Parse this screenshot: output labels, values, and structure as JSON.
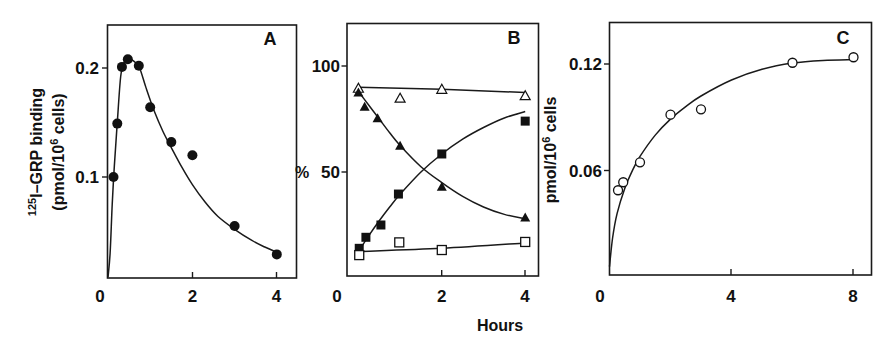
{
  "figure": {
    "x_axis_label": "Hours",
    "panels": [
      {
        "id": "A",
        "label": "A",
        "ylabel_line1_sup": "125",
        "ylabel_line1": "I–GRP binding",
        "ylabel_line2_pre": "(pmol/10",
        "ylabel_line2_sup": "6",
        "ylabel_line2_post": " cells)",
        "xticks": [
          "0",
          "2",
          "4"
        ],
        "yticks": [
          "0.1",
          "0.2"
        ]
      },
      {
        "id": "B",
        "label": "B",
        "ylabel": "%",
        "xticks": [
          "0",
          "2",
          "4"
        ],
        "yticks": [
          "50",
          "100"
        ]
      },
      {
        "id": "C",
        "label": "C",
        "ylabel_pre": "pmol/10",
        "ylabel_sup": "6",
        "ylabel_post": " cells",
        "xticks": [
          "0",
          "4",
          "8"
        ],
        "yticks": [
          "0.06",
          "0.12"
        ]
      }
    ]
  },
  "chart_data": [
    {
      "panel": "A",
      "type": "line",
      "title": "A",
      "xlabel": "Hours",
      "ylabel": "125I-GRP binding (pmol/10^6 cells)",
      "xlim": [
        0,
        4.4
      ],
      "ylim": [
        0.008,
        0.24
      ],
      "xticks": [
        0,
        2,
        4
      ],
      "yticks": [
        0.1,
        0.2
      ],
      "grid": false,
      "series": [
        {
          "name": "125I-GRP binding (total)",
          "marker": "filled-circle",
          "x": [
            0.13,
            0.22,
            0.33,
            0.47,
            0.73,
            1.0,
            1.5,
            2.0,
            3.0,
            4.0
          ],
          "y": [
            0.1,
            0.149,
            0.201,
            0.208,
            0.202,
            0.164,
            0.132,
            0.12,
            0.055,
            0.029
          ]
        }
      ],
      "fit_curve": {
        "x": [
          0,
          0.05,
          0.1,
          0.15,
          0.22,
          0.3,
          0.38,
          0.47,
          0.55,
          0.65,
          0.75,
          0.9,
          1.1,
          1.3,
          1.5,
          1.75,
          2.0,
          2.3,
          2.6,
          3.0,
          3.4,
          3.7,
          4.0
        ],
        "y": [
          0.008,
          0.03,
          0.075,
          0.11,
          0.15,
          0.192,
          0.205,
          0.209,
          0.208,
          0.205,
          0.2,
          0.182,
          0.16,
          0.142,
          0.127,
          0.109,
          0.093,
          0.077,
          0.064,
          0.052,
          0.042,
          0.036,
          0.031
        ]
      }
    },
    {
      "panel": "B",
      "type": "line",
      "title": "B",
      "xlabel": "Hours",
      "ylabel": "%",
      "xlim": [
        -0.27,
        4.3
      ],
      "ylim": [
        0,
        120
      ],
      "xticks": [
        0,
        2,
        4
      ],
      "yticks": [
        50,
        100
      ],
      "grid": false,
      "series": [
        {
          "name": "open triangles",
          "marker": "open-triangle",
          "x": [
            0.0,
            1.0,
            2.0,
            4.0
          ],
          "y": [
            89.5,
            84.8,
            89,
            86
          ]
        },
        {
          "name": "filled triangles",
          "marker": "filled-triangle",
          "x": [
            0.0,
            0.15,
            0.46,
            1.0,
            2.0,
            4.0
          ],
          "y": [
            87.5,
            80.8,
            75.3,
            62.4,
            43,
            28.5
          ]
        },
        {
          "name": "filled squares",
          "marker": "filled-square",
          "x": [
            0.02,
            0.18,
            0.54,
            0.96,
            2.0,
            4.0
          ],
          "y": [
            14,
            19.2,
            25,
            39.6,
            58.5,
            74
          ]
        },
        {
          "name": "open squares",
          "marker": "open-square",
          "x": [
            0.02,
            0.98,
            2.0,
            4.0
          ],
          "y": [
            10.8,
            16.8,
            13.2,
            17
          ]
        }
      ],
      "fit_curves": [
        {
          "series": "open triangles",
          "x": [
            0.0,
            2.0,
            4.0
          ],
          "y": [
            90,
            89,
            87.5
          ]
        },
        {
          "series": "filled triangles",
          "x": [
            0.0,
            0.25,
            0.5,
            0.75,
            1.0,
            1.5,
            2.0,
            2.5,
            3.0,
            3.5,
            4.0
          ],
          "y": [
            88,
            81.5,
            75,
            68.5,
            62.5,
            52.5,
            45,
            38.5,
            33.5,
            30,
            28
          ]
        },
        {
          "series": "filled squares",
          "x": [
            0.02,
            0.25,
            0.5,
            0.75,
            1.0,
            1.5,
            2.0,
            2.5,
            3.0,
            3.5,
            4.0
          ],
          "y": [
            13,
            20,
            27,
            33.5,
            39.5,
            50,
            58.5,
            65.5,
            71,
            75.5,
            78.5
          ]
        },
        {
          "series": "open squares",
          "x": [
            0.02,
            2.0,
            4.0
          ],
          "y": [
            12.5,
            14,
            16.5
          ]
        }
      ]
    },
    {
      "panel": "C",
      "type": "line",
      "title": "C",
      "xlabel": "Hours",
      "ylabel": "pmol/10^6 cells",
      "xlim": [
        0,
        8.6
      ],
      "ylim": [
        0,
        0.143
      ],
      "xticks": [
        0,
        4,
        8
      ],
      "yticks": [
        0.06,
        0.12
      ],
      "grid": false,
      "series": [
        {
          "name": "open circles",
          "marker": "open-circle",
          "x": [
            0.28,
            0.45,
            1.0,
            2.0,
            3.0,
            6.0,
            8.0
          ],
          "y": [
            0.049,
            0.0535,
            0.0647,
            0.0915,
            0.0945,
            0.1207,
            0.1238
          ]
        }
      ],
      "fit_curve": {
        "x": [
          0,
          0.1,
          0.25,
          0.5,
          0.75,
          1.0,
          1.5,
          2.0,
          2.5,
          3.0,
          4.0,
          5.0,
          6.0,
          7.0,
          8.0
        ],
        "y": [
          0.006,
          0.022,
          0.036,
          0.05,
          0.06,
          0.068,
          0.08,
          0.089,
          0.096,
          0.102,
          0.111,
          0.117,
          0.1205,
          0.122,
          0.1225
        ]
      }
    }
  ]
}
